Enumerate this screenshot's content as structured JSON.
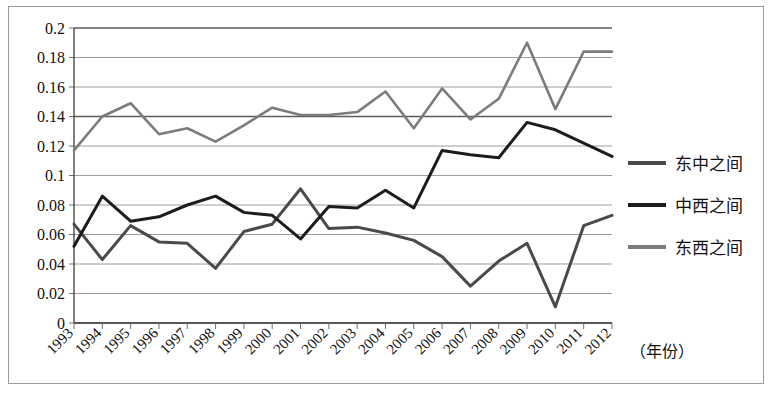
{
  "chart_data": {
    "type": "line",
    "title": "",
    "xlabel": "（年份）",
    "ylabel": "",
    "categories": [
      "1993",
      "1994",
      "1995",
      "1996",
      "1997",
      "1998",
      "1999",
      "2000",
      "2001",
      "2002",
      "2003",
      "2004",
      "2005",
      "2006",
      "2007",
      "2008",
      "2009",
      "2010",
      "2011",
      "2012"
    ],
    "ylim": [
      0,
      0.2
    ],
    "ytick_values": [
      0,
      0.02,
      0.04,
      0.06,
      0.08,
      0.1,
      0.12,
      0.14,
      0.16,
      0.18,
      0.2
    ],
    "ytick_labels": [
      "0",
      "0.02",
      "0.04",
      "0.06",
      "0.08",
      "0.1",
      "0.12",
      "0.14",
      "0.16",
      "0.18",
      "0.2"
    ],
    "grid": true,
    "legend_position": "right",
    "series": [
      {
        "name": "东中之间",
        "color": "#4a4a4a",
        "values": [
          0.067,
          0.043,
          0.066,
          0.055,
          0.054,
          0.037,
          0.062,
          0.067,
          0.091,
          0.064,
          0.065,
          0.061,
          0.056,
          0.045,
          0.025,
          0.042,
          0.054,
          0.011,
          0.066,
          0.073
        ]
      },
      {
        "name": "中西之间",
        "color": "#1c1c1c",
        "values": [
          0.052,
          0.086,
          0.069,
          0.072,
          0.08,
          0.086,
          0.075,
          0.073,
          0.057,
          0.079,
          0.078,
          0.09,
          0.078,
          0.117,
          0.114,
          0.112,
          0.136,
          0.131,
          0.122,
          0.113
        ]
      },
      {
        "name": "东西之间",
        "color": "#7c7c7c",
        "values": [
          0.117,
          0.14,
          0.149,
          0.128,
          0.132,
          0.123,
          0.134,
          0.146,
          0.141,
          0.141,
          0.143,
          0.157,
          0.132,
          0.159,
          0.138,
          0.152,
          0.19,
          0.145,
          0.184,
          0.184
        ]
      }
    ]
  },
  "legend": {
    "items": [
      {
        "label": "东中之间"
      },
      {
        "label": "中西之间"
      },
      {
        "label": "东西之间"
      }
    ]
  },
  "axis": {
    "x_caption": "（年份）"
  }
}
